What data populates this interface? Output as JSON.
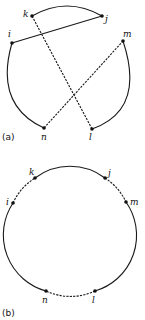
{
  "figure_a": {
    "caption": "(a)",
    "points": {
      "k": {
        "label": "k",
        "x": 32,
        "y": 16
      },
      "j": {
        "label": "j",
        "x": 102,
        "y": 16
      },
      "i": {
        "label": "i",
        "x": 12,
        "y": 43
      },
      "m": {
        "label": "m",
        "x": 123,
        "y": 41
      },
      "n": {
        "label": "n",
        "x": 44,
        "y": 128
      },
      "l": {
        "label": "l",
        "x": 92,
        "y": 129
      }
    },
    "edges": [
      {
        "from": "k",
        "to": "j",
        "type": "arc",
        "style": "solid"
      },
      {
        "from": "i",
        "to": "n",
        "type": "arc",
        "style": "solid"
      },
      {
        "from": "m",
        "to": "l",
        "type": "arc",
        "style": "solid"
      },
      {
        "from": "i",
        "to": "j",
        "type": "chord",
        "style": "solid"
      },
      {
        "from": "k",
        "to": "l",
        "type": "chord",
        "style": "dashed"
      },
      {
        "from": "n",
        "to": "m",
        "type": "chord",
        "style": "dashed"
      }
    ]
  },
  "figure_b": {
    "caption": "(b)",
    "points": {
      "k": {
        "label": "k",
        "x": 35,
        "y": 178
      },
      "j": {
        "label": "j",
        "x": 105,
        "y": 178
      },
      "i": {
        "label": "i",
        "x": 13,
        "y": 203
      },
      "m": {
        "label": "m",
        "x": 126,
        "y": 202
      },
      "n": {
        "label": "n",
        "x": 46,
        "y": 291
      },
      "l": {
        "label": "l",
        "x": 95,
        "y": 291
      }
    },
    "edges": [
      {
        "from": "k",
        "to": "j",
        "type": "arc",
        "style": "solid"
      },
      {
        "from": "i",
        "to": "k",
        "type": "arc",
        "style": "dashed"
      },
      {
        "from": "j",
        "to": "m",
        "type": "arc",
        "style": "dashed"
      },
      {
        "from": "i",
        "to": "n",
        "type": "arc",
        "style": "solid"
      },
      {
        "from": "m",
        "to": "l",
        "type": "arc",
        "style": "solid"
      },
      {
        "from": "n",
        "to": "l",
        "type": "arc",
        "style": "dashed"
      }
    ]
  }
}
